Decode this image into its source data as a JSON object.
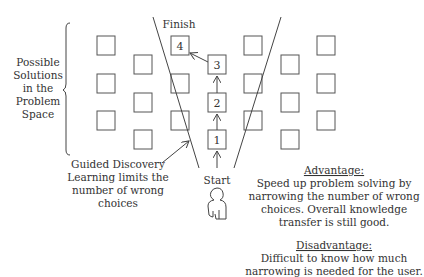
{
  "labels": {
    "finish": "Finish",
    "start": "Start",
    "possible_solutions": [
      "Possible",
      "Solutions",
      "in the",
      "Problem",
      "Space"
    ],
    "guided_discovery": [
      "Guided Discovery",
      "Learning limits the",
      "number of wrong",
      "choices"
    ]
  },
  "path_steps": [
    "1",
    "2",
    "3",
    "4"
  ],
  "advantage": {
    "heading": "Advantage:",
    "lines": [
      "Speed up problem solving by",
      "narrowing the number of wrong",
      "choices. Overall knowledge",
      "transfer is still good."
    ]
  },
  "disadvantage": {
    "heading": "Disadvantage:",
    "lines": [
      "Difficult to know how much",
      "narrowing is needed for the user."
    ]
  },
  "icons": {
    "person": "person-outline-icon",
    "brace": "curly-brace-icon"
  },
  "colors": {
    "stroke": "#444444",
    "text": "#333333",
    "background": "#ffffff"
  }
}
